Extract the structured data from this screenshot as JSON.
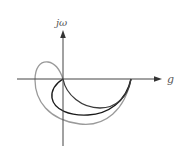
{
  "diagram": {
    "type": "nyquist-plot",
    "axes": {
      "vertical_label": "jω",
      "horizontal_label": "g"
    },
    "curves": [
      {
        "name": "inner-curve",
        "color": "#3a3a3a"
      },
      {
        "name": "middle-curve",
        "color": "#1a1a1a"
      },
      {
        "name": "outer-curve",
        "color": "#999999"
      }
    ],
    "colors": {
      "axis": "#444444",
      "background": "#ffffff"
    }
  }
}
